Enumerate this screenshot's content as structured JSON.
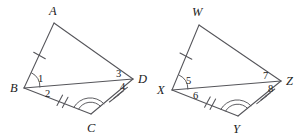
{
  "figure": {
    "background_color": "#ffffff",
    "stroke_color": "#55555a",
    "label_color": "#1c1c1c"
  },
  "left_figure": {
    "name": "quadrilateral-abcd",
    "vertices": {
      "A": {
        "label": "A",
        "x": 54,
        "y": 23,
        "label_x": 49,
        "label_y": 15
      },
      "B": {
        "label": "B",
        "x": 24,
        "y": 88,
        "label_x": 10,
        "label_y": 92
      },
      "C": {
        "label": "C",
        "x": 91,
        "y": 114,
        "label_x": 87,
        "label_y": 132
      },
      "D": {
        "label": "D",
        "x": 133,
        "y": 79,
        "label_x": 138,
        "label_y": 83
      }
    },
    "angle_numbers": [
      {
        "label": "1",
        "x": 38,
        "y": 82
      },
      {
        "label": "2",
        "x": 45,
        "y": 97
      },
      {
        "label": "3",
        "x": 116,
        "y": 77
      },
      {
        "label": "4",
        "x": 120,
        "y": 90
      }
    ],
    "segment_ticks": [
      {
        "segment": "AB",
        "count": 1
      },
      {
        "segment": "BC",
        "count": 2
      },
      {
        "segment": "CD",
        "count": 3
      }
    ],
    "angle_arcs": [
      {
        "vertex": "B",
        "count": 1
      },
      {
        "vertex": "C",
        "count": 2
      }
    ]
  },
  "right_figure": {
    "name": "quadrilateral-wxyz",
    "vertices": {
      "W": {
        "label": "W",
        "x": 199,
        "y": 25,
        "label_x": 192,
        "label_y": 16
      },
      "X": {
        "label": "X",
        "x": 172,
        "y": 90,
        "label_x": 157,
        "label_y": 94
      },
      "Y": {
        "label": "Y",
        "x": 238,
        "y": 116,
        "label_x": 233,
        "label_y": 133
      },
      "Z": {
        "label": "Z",
        "x": 281,
        "y": 81,
        "label_x": 286,
        "label_y": 85
      }
    },
    "angle_numbers": [
      {
        "label": "5",
        "x": 186,
        "y": 84
      },
      {
        "label": "6",
        "x": 193,
        "y": 99
      },
      {
        "label": "7",
        "x": 263,
        "y": 79
      },
      {
        "label": "8",
        "x": 268,
        "y": 92
      }
    ],
    "segment_ticks": [
      {
        "segment": "WX",
        "count": 1
      },
      {
        "segment": "XY",
        "count": 2
      },
      {
        "segment": "YZ",
        "count": 3
      }
    ],
    "angle_arcs": [
      {
        "vertex": "X",
        "count": 1
      },
      {
        "vertex": "Y",
        "count": 2
      }
    ]
  }
}
